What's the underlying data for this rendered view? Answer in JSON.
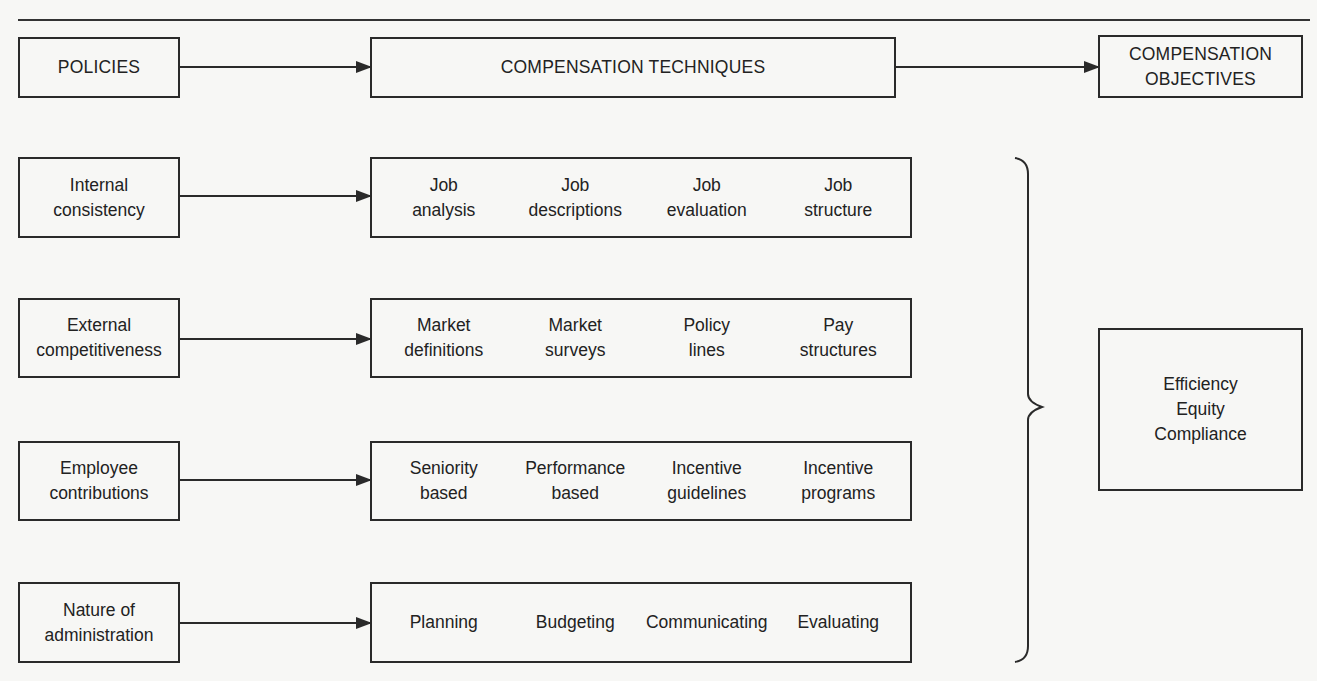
{
  "diagram": {
    "header": {
      "policies": "POLICIES",
      "techniques": "COMPENSATION TECHNIQUES",
      "objectives": "COMPENSATION\nOBJECTIVES"
    },
    "rows": [
      {
        "policy": "Internal\nconsistency",
        "techniques": [
          "Job\nanalysis",
          "Job\ndescriptions",
          "Job\nevaluation",
          "Job\nstructure"
        ]
      },
      {
        "policy": "External\ncompetitiveness",
        "techniques": [
          "Market\ndefinitions",
          "Market\nsurveys",
          "Policy\nlines",
          "Pay\nstructures"
        ]
      },
      {
        "policy": "Employee\ncontributions",
        "techniques": [
          "Seniority\nbased",
          "Performance\nbased",
          "Incentive\nguidelines",
          "Incentive\nprograms"
        ]
      },
      {
        "policy": "Nature of\nadministration",
        "techniques": [
          "Planning",
          "Budgeting",
          "Communicating",
          "Evaluating"
        ]
      }
    ],
    "objectives": "Efficiency\nEquity\nCompliance",
    "colors": {
      "line": "#2a2a2a",
      "background": "#f7f7f5",
      "text": "#222222"
    }
  }
}
